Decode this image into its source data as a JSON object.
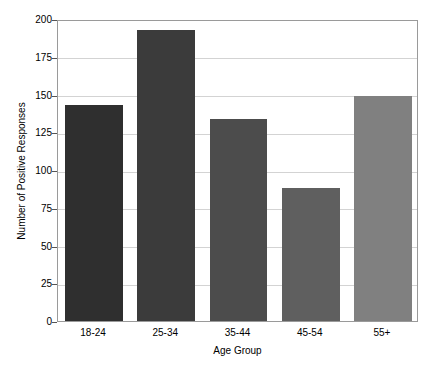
{
  "chart_data": {
    "type": "bar",
    "title": "",
    "xlabel": "Age Group",
    "ylabel": "Number of Positive Responses",
    "categories": [
      "18-24",
      "25-34",
      "35-44",
      "45-54",
      "55+"
    ],
    "values": [
      143,
      193,
      134,
      88,
      149
    ],
    "ylim": [
      0,
      200
    ],
    "yticks": [
      0,
      25,
      50,
      75,
      100,
      125,
      150,
      175,
      200
    ],
    "ytick_labels": [
      "0",
      "25",
      "50",
      "75",
      "100",
      "125",
      "150",
      "175",
      "200"
    ],
    "grid": true,
    "grid_axis": "y",
    "grid_color": "#d3d3d3",
    "legend": null,
    "bar_colors": [
      "#2f2f2f",
      "#3b3b3b",
      "#4c4c4c",
      "#5f5f5f",
      "#808080"
    ],
    "bar_width_ratio": 0.8,
    "background_color": "#ffffff",
    "axes_edge_color": "#9a9a9a",
    "tick_color": "#555555",
    "text_color": "#000000"
  }
}
